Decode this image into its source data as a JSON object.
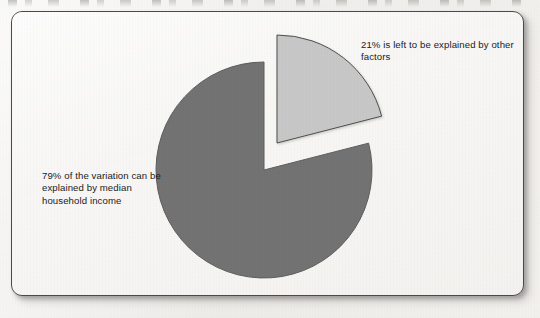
{
  "figure": {
    "background_color": "#f1efec",
    "card_color": "#f7f6f4",
    "card_border_color": "#4a4a4a"
  },
  "labels": {
    "right": "21% is left to be explained by other factors",
    "left": "79% of the variation can be explained by median household income"
  },
  "chart_data": {
    "type": "pie",
    "title": "",
    "subtitle": "",
    "xlabel": "",
    "ylabel": "",
    "legend_position": "none",
    "grid": false,
    "units": "percent",
    "start_angle_deg": 0,
    "direction": "clockwise",
    "center": {
      "x": 252,
      "y": 158
    },
    "radius": 108,
    "categories": [
      "79% of the variation can be explained by median household income",
      "21% is left to be explained by other factors"
    ],
    "values": [
      79,
      21
    ],
    "slices": [
      {
        "label": "79% of the variation can be explained by median household income",
        "short_label": "Explained by median household income",
        "value": 79,
        "percent": "79%",
        "color": "#737373",
        "edge_color": "#5e5e5e",
        "exploded": false,
        "offset": {
          "x": 0,
          "y": 0
        },
        "start_angle_deg": 75.6,
        "end_angle_deg": 360
      },
      {
        "label": "21% is left to be explained by other factors",
        "short_label": "Other factors",
        "value": 21,
        "percent": "21%",
        "color": "#c8c8c8",
        "edge_color": "#4f4f4f",
        "exploded": true,
        "offset": {
          "x": 13,
          "y": -27
        },
        "start_angle_deg": 0,
        "end_angle_deg": 75.6
      }
    ]
  }
}
